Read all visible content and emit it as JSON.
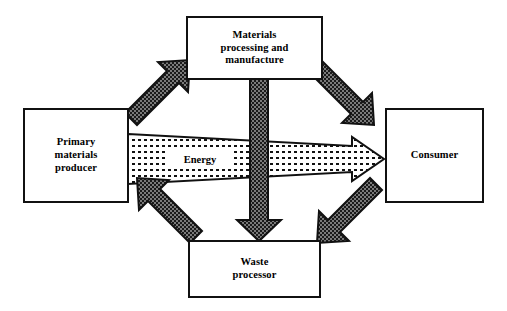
{
  "diagram": {
    "background_color": "#ffffff",
    "outline_color": "#111111",
    "arrow_fill_color": "#1a1a1a",
    "energy_arrow_fill": "#ffffff",
    "nodes": [
      {
        "id": "materials",
        "label": "Materials\nprocessing and\nmanufacture",
        "position": "top"
      },
      {
        "id": "primary",
        "label": "Primary\nmaterials\nproducer",
        "position": "left"
      },
      {
        "id": "consumer",
        "label": "Consumer",
        "position": "right"
      },
      {
        "id": "waste",
        "label": "Waste\nprocessor",
        "position": "bottom"
      }
    ],
    "flows": [
      {
        "id": "primary-to-materials",
        "from": "primary",
        "to": "materials",
        "direction": "up-right",
        "style": "solid-textured"
      },
      {
        "id": "materials-to-consumer",
        "from": "materials",
        "to": "consumer",
        "direction": "down-right",
        "style": "solid-textured"
      },
      {
        "id": "consumer-to-waste",
        "from": "consumer",
        "to": "waste",
        "direction": "down-left",
        "style": "solid-textured"
      },
      {
        "id": "waste-to-primary",
        "from": "waste",
        "to": "primary",
        "direction": "up-left",
        "style": "solid-textured"
      },
      {
        "id": "materials-to-waste",
        "from": "materials",
        "to": "waste",
        "direction": "down",
        "style": "solid-textured"
      },
      {
        "id": "energy-flow",
        "label": "Energy",
        "from": "primary",
        "to": "consumer",
        "direction": "right",
        "style": "outlined-stippled-tapered"
      }
    ]
  }
}
